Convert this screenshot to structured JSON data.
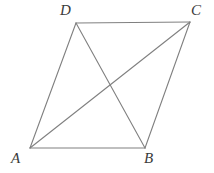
{
  "figure": {
    "name": "parallelogram-with-diagonals",
    "background_color": "#ffffff",
    "stroke_color": "#808080",
    "label_color": "#3a3a3a",
    "stroke_width": 1.1,
    "width": 214,
    "height": 173,
    "vertices": [
      {
        "id": "A",
        "label": "A",
        "x": 30,
        "y": 148
      },
      {
        "id": "B",
        "label": "B",
        "x": 145,
        "y": 148
      },
      {
        "id": "C",
        "label": "C",
        "x": 190,
        "y": 22
      },
      {
        "id": "D",
        "label": "D",
        "x": 76,
        "y": 23
      }
    ],
    "sides": [
      {
        "id": "AB",
        "from": "A",
        "to": "B",
        "x1": 30,
        "y1": 148,
        "x2": 145,
        "y2": 148
      },
      {
        "id": "BC",
        "from": "B",
        "to": "C",
        "x1": 145,
        "y1": 148,
        "x2": 190,
        "y2": 22
      },
      {
        "id": "CD",
        "from": "C",
        "to": "D",
        "x1": 190,
        "y1": 22,
        "x2": 76,
        "y2": 23
      },
      {
        "id": "DA",
        "from": "D",
        "to": "A",
        "x1": 76,
        "y1": 23,
        "x2": 30,
        "y2": 148
      }
    ],
    "diagonals": [
      {
        "id": "AC",
        "from": "A",
        "to": "C",
        "x1": 30,
        "y1": 148,
        "x2": 190,
        "y2": 22
      },
      {
        "id": "DB",
        "from": "D",
        "to": "B",
        "x1": 76,
        "y1": 23,
        "x2": 145,
        "y2": 148
      }
    ],
    "intersection": {
      "x": 107,
      "y": 88
    }
  }
}
